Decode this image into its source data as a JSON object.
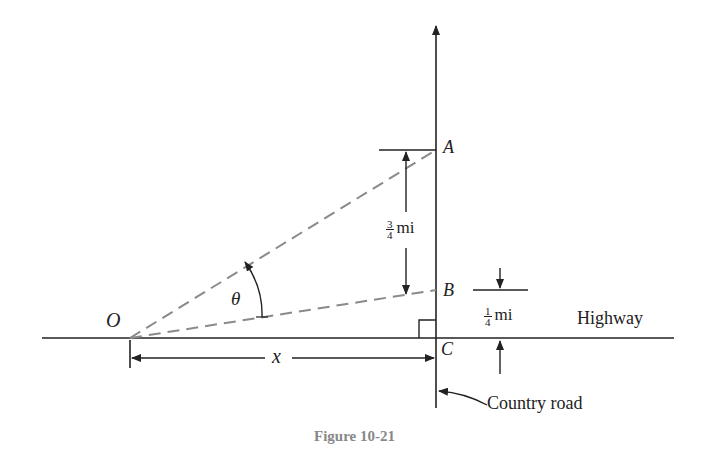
{
  "figure": {
    "caption": "Figure 10-21",
    "points": {
      "O": "O",
      "A": "A",
      "B": "B",
      "C": "C"
    },
    "angle_label": "θ",
    "distance_label": "x",
    "dimension_AB": {
      "num": "3",
      "den": "4",
      "unit": "mi"
    },
    "dimension_BC": {
      "num": "1",
      "den": "4",
      "unit": "mi"
    },
    "road_labels": {
      "highway": "Highway",
      "country_road": "Country road"
    },
    "colors": {
      "line": "#222222",
      "dashed": "#8a8a8a",
      "caption": "#888888"
    }
  }
}
